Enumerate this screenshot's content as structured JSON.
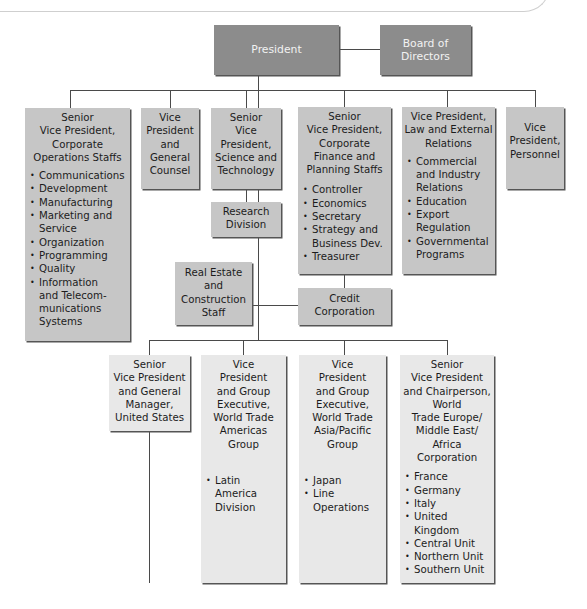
{
  "chart": {
    "top": {
      "president": "President",
      "board": "Board of Directors"
    },
    "row1": [
      {
        "id": "svp-corporate-operations",
        "title": "Senior Vice President, Corporate Operations Staffs",
        "title_lines": [
          "Senior",
          "Vice President,",
          "Corporate",
          "Operations Staffs"
        ],
        "items": [
          "Communications",
          "Development",
          "Manufacturing",
          "Marketing and Service",
          "Organization",
          "Programming",
          "Quality",
          "Information and Telecom-munications Systems"
        ]
      },
      {
        "id": "vp-general-counsel",
        "title": "Vice President and General Counsel",
        "title_lines": [
          "Vice",
          "President",
          "and",
          "General",
          "Counsel"
        ],
        "items": []
      },
      {
        "id": "svp-science-technology",
        "title": "Senior Vice President, Science and Technology",
        "title_lines": [
          "Senior",
          "Vice",
          "President,",
          "Science and",
          "Technology"
        ],
        "items": [],
        "child": "Research Division"
      },
      {
        "id": "svp-finance-planning",
        "title": "Senior Vice President, Corporate Finance and Planning Staffs",
        "title_lines": [
          "Senior",
          "Vice President,",
          "Corporate",
          "Finance and",
          "Planning Staffs"
        ],
        "items": [
          "Controller",
          "Economics",
          "Secretary",
          "Strategy and Business Dev.",
          "Treasurer"
        ],
        "child": "Credit Corporation"
      },
      {
        "id": "vp-law-external",
        "title": "Vice President, Law and External Relations",
        "title_lines": [
          "Vice President,",
          "Law and External",
          "Relations"
        ],
        "items": [
          "Commercial and Industry Relations",
          "Education",
          "Export Regulation",
          "Governmental Programs"
        ]
      },
      {
        "id": "vp-personnel",
        "title": "Vice President, Personnel",
        "title_lines": [
          "Vice",
          "President,",
          "Personnel"
        ],
        "items": []
      }
    ],
    "staff": {
      "real_estate": "Real Estate and Construction Staff",
      "real_estate_lines": [
        "Real Estate",
        "and",
        "Construction",
        "Staff"
      ],
      "credit_lines": [
        "Credit",
        "Corporation"
      ],
      "research_lines": [
        "Research",
        "Division"
      ],
      "board_lines": [
        "Board of",
        "Directors"
      ]
    },
    "row2": [
      {
        "id": "svp-gm-us",
        "title": "Senior Vice President and General Manager, United States",
        "title_lines": [
          "Senior",
          "Vice President",
          "and General",
          "Manager,",
          "United States"
        ],
        "items": []
      },
      {
        "id": "vp-americas",
        "title": "Vice President and Group Executive, World Trade Americas Group",
        "title_lines": [
          "Vice",
          "President",
          "and Group",
          "Executive,",
          "World Trade",
          "Americas",
          "Group"
        ],
        "items": [
          "Latin America Division"
        ]
      },
      {
        "id": "vp-asia-pacific",
        "title": "Vice President and Group Executive, World Trade Asia/Pacific Group",
        "title_lines": [
          "Vice",
          "President",
          "and Group",
          "Executive,",
          "World Trade",
          "Asia/Pacific",
          "Group"
        ],
        "items": [
          "Japan",
          "Line Operations"
        ]
      },
      {
        "id": "svp-europe",
        "title": "Senior Vice President and Chairperson, World Trade Europe/Middle East/Africa Corporation",
        "title_lines": [
          "Senior",
          "Vice President",
          "and Chairperson,",
          "World",
          "Trade Europe/",
          "Middle East/",
          "Africa",
          "Corporation"
        ],
        "items": [
          "France",
          "Germany",
          "Italy",
          "United Kingdom",
          "Central Unit",
          "Northern Unit",
          "Southern Unit"
        ]
      }
    ]
  },
  "colors": {
    "top_box": "#8c8c8c",
    "staff_box": "#c6c6c6",
    "line_box": "#e8e8e8",
    "connector": "#4a4a4a"
  }
}
